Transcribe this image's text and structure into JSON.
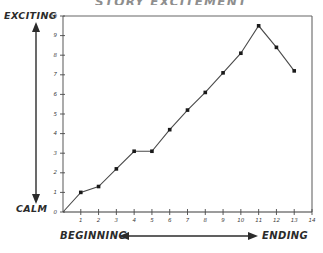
{
  "title": "STORY EXCITEMENT",
  "axes": {
    "y_top_label": "EXCITING",
    "y_bottom_label": "CALM",
    "x_left_label": "BEGINNING",
    "x_right_label": "ENDING",
    "y_ticks": [
      "0",
      "1",
      "2",
      "3",
      "4",
      "5",
      "6",
      "7",
      "8",
      "9",
      "10"
    ],
    "x_ticks": [
      "1",
      "2",
      "3",
      "4",
      "5",
      "6",
      "7",
      "8",
      "9",
      "10",
      "11",
      "12",
      "13",
      "14"
    ]
  },
  "colors": {
    "ink": "#2b2b2b",
    "line": "#4a4a4a",
    "marker": "#1a1a1a",
    "frame": "#555555",
    "paper": "#ffffff"
  },
  "chart_data": {
    "type": "line",
    "title": "STORY EXCITEMENT",
    "xlabel": "BEGINNING ↔ ENDING",
    "ylabel": "CALM → EXCITING",
    "xlim": [
      0,
      14
    ],
    "ylim": [
      0,
      10
    ],
    "grid": false,
    "legend": "none",
    "categories": [
      0,
      1,
      2,
      3,
      4,
      5,
      6,
      7,
      8,
      9,
      10,
      11,
      12,
      13
    ],
    "values": [
      0,
      1,
      1.3,
      2.2,
      3.1,
      3.1,
      4.2,
      5.2,
      6.1,
      7.1,
      8.1,
      9.5,
      8.4,
      7.2
    ],
    "annotations": [
      "Flat segment between x=4 and x=5",
      "Peak at x=11",
      "Decline after peak toward ending"
    ]
  }
}
